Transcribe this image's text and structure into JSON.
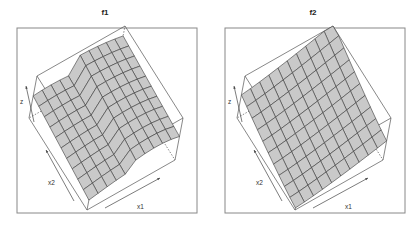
{
  "chart_data": [
    {
      "type": "surface3d",
      "title": "f1",
      "xlabel": "x1",
      "ylabel": "x2",
      "zlabel": "z",
      "grid_size": [
        10,
        10
      ],
      "description": "Wireframe perspective surface with a ridge/valley fold along x1 midpoint; raised back edge along x2 and curved saddle-like shape",
      "surface_color": "#c9c9c9",
      "line_color": "#3a3a3a",
      "box": true,
      "ticks": false
    },
    {
      "type": "surface3d",
      "title": "f2",
      "xlabel": "x1",
      "ylabel": "x2",
      "zlabel": "z",
      "grid_size": [
        10,
        10
      ],
      "description": "Wireframe perspective surface, smoothly increasing toward the far corner (high x1, high x2), slightly convex",
      "surface_color": "#c9c9c9",
      "line_color": "#3a3a3a",
      "box": true,
      "ticks": false
    }
  ],
  "panels": [
    {
      "title": "f1",
      "x1_label": "x1",
      "x2_label": "x2",
      "z_label": "z"
    },
    {
      "title": "f2",
      "x1_label": "x1",
      "x2_label": "x2",
      "z_label": "z"
    }
  ]
}
